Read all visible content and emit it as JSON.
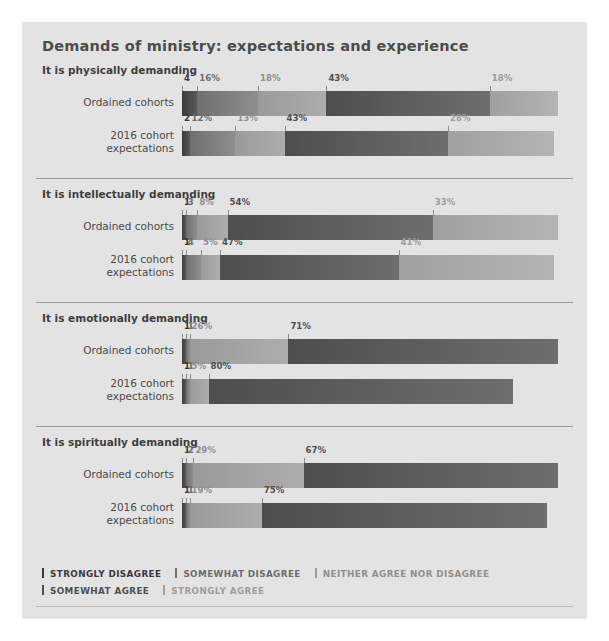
{
  "chart_data": {
    "type": "bar",
    "title": "Demands of ministry: expectations and experience",
    "xlabel": "",
    "ylabel": "",
    "orientation": "horizontal",
    "stacked": true,
    "xlim": [
      0,
      100
    ],
    "grid": false,
    "legend_position": "bottom",
    "legend": [
      {
        "name": "STRONGLY DISAGREE",
        "color": "#3b3b3b"
      },
      {
        "name": "SOMEWHAT DISAGREE",
        "color": "#6f6f6f"
      },
      {
        "name": "NEITHER AGREE NOR DISAGREE",
        "color": "#9a9a9a"
      },
      {
        "name": "SOMEWHAT AGREE",
        "color": "#4e4e4e"
      },
      {
        "name": "STRONGLY AGREE",
        "color": "#a0a0a0"
      }
    ],
    "categories": [
      "STRONGLY DISAGREE",
      "SOMEWHAT DISAGREE",
      "NEITHER AGREE NOR DISAGREE",
      "SOMEWHAT AGREE",
      "STRONGLY AGREE"
    ],
    "sections": [
      {
        "heading": "It is physically demanding",
        "rows": [
          {
            "label": "Ordained cohorts",
            "values": [
              4,
              16,
              18,
              43,
              18
            ],
            "labels": [
              "4",
              "16%",
              "18%",
              "43%",
              "18%"
            ]
          },
          {
            "label": "2016 cohort expectations",
            "label_lines": [
              "2016 cohort",
              "expectations"
            ],
            "values": [
              2,
              12,
              13,
              43,
              28
            ],
            "labels": [
              "2",
              "12%",
              "13%",
              "43%",
              "28%"
            ]
          }
        ]
      },
      {
        "heading": "It is intellectually demanding",
        "rows": [
          {
            "label": "Ordained cohorts",
            "values": [
              1,
              3,
              8,
              54,
              33
            ],
            "labels": [
              "1",
              "3",
              "8%",
              "54%",
              "33%"
            ]
          },
          {
            "label": "2016 cohort expectations",
            "label_lines": [
              "2016 cohort",
              "expectations"
            ],
            "values": [
              1,
              4,
              5,
              47,
              41
            ],
            "labels": [
              "1",
              "4",
              "5%",
              "47%",
              "41%"
            ]
          }
        ]
      },
      {
        "heading": "It is emotionally demanding",
        "rows": [
          {
            "label": "Ordained cohorts",
            "values": [
              1,
              1,
              26,
              71
            ],
            "labels": [
              "1",
              "1",
              "26%",
              "71%"
            ]
          },
          {
            "label": "2016 cohort expectations",
            "label_lines": [
              "2016 cohort",
              "expectations"
            ],
            "values": [
              1,
              1,
              5,
              80
            ],
            "labels": [
              "1",
              "1",
              "5%",
              "80%"
            ]
          }
        ]
      },
      {
        "heading": "It is spiritually demanding",
        "rows": [
          {
            "label": "Ordained cohorts",
            "values": [
              1,
              2,
              29,
              67
            ],
            "labels": [
              "1",
              "2",
              "29%",
              "67%"
            ]
          },
          {
            "label": "2016 cohort expectations",
            "label_lines": [
              "2016 cohort",
              "expectations"
            ],
            "values": [
              1,
              1,
              19,
              75
            ],
            "labels": [
              "1",
              "1",
              "19%",
              "75%"
            ]
          }
        ]
      }
    ]
  }
}
